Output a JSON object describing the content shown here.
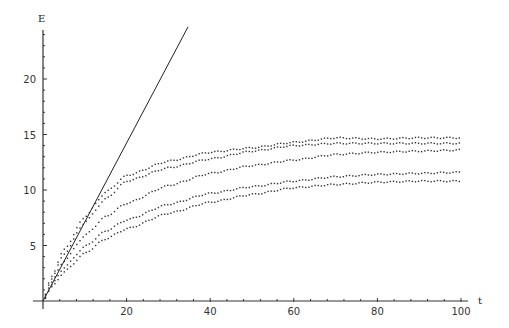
{
  "chart_data": {
    "type": "scatter",
    "title": "",
    "xlabel": "t",
    "ylabel": "E",
    "xlim": [
      0,
      100
    ],
    "ylim": [
      0,
      25
    ],
    "x_ticks": [
      20,
      40,
      60,
      80,
      100
    ],
    "y_ticks": [
      5,
      10,
      15,
      20
    ],
    "x_minor_step": 4,
    "y_minor_step": 1,
    "grid": false,
    "legend": "none",
    "line": {
      "name": "linear",
      "style": "solid",
      "x": [
        0,
        34.7
      ],
      "y": [
        0,
        24.7
      ]
    },
    "series": [
      {
        "name": "curve-1",
        "style": "dotted",
        "x": [
          0,
          2,
          5,
          10,
          15,
          20,
          30,
          40,
          50,
          60,
          70,
          80,
          90,
          100
        ],
        "y": [
          0,
          2.2,
          4.6,
          7.6,
          9.8,
          11.3,
          12.6,
          13.4,
          13.8,
          14.3,
          14.7,
          14.6,
          14.7,
          14.7
        ]
      },
      {
        "name": "curve-2",
        "style": "dotted",
        "x": [
          0,
          2,
          5,
          10,
          15,
          20,
          30,
          40,
          50,
          60,
          70,
          80,
          90,
          100
        ],
        "y": [
          0,
          2.0,
          4.2,
          7.1,
          9.2,
          10.8,
          12.0,
          12.8,
          13.5,
          14.0,
          14.2,
          14.2,
          14.2,
          14.2
        ]
      },
      {
        "name": "curve-3",
        "style": "dotted",
        "x": [
          0,
          2,
          5,
          10,
          15,
          20,
          30,
          40,
          50,
          60,
          70,
          80,
          90,
          100
        ],
        "y": [
          0,
          1.7,
          3.6,
          5.9,
          7.6,
          8.8,
          10.4,
          11.5,
          12.2,
          12.7,
          13.2,
          13.4,
          13.5,
          13.6
        ]
      },
      {
        "name": "curve-4",
        "style": "dotted",
        "x": [
          0,
          2,
          5,
          10,
          15,
          20,
          30,
          40,
          50,
          60,
          70,
          80,
          90,
          100
        ],
        "y": [
          0,
          1.4,
          3.0,
          4.9,
          6.3,
          7.3,
          8.7,
          9.7,
          10.3,
          10.8,
          11.2,
          11.4,
          11.5,
          11.6
        ]
      },
      {
        "name": "curve-5",
        "style": "dotted",
        "x": [
          0,
          2,
          5,
          10,
          15,
          20,
          30,
          40,
          50,
          60,
          70,
          80,
          90,
          100
        ],
        "y": [
          0,
          1.2,
          2.6,
          4.3,
          5.6,
          6.5,
          7.9,
          8.9,
          9.6,
          10.2,
          10.5,
          10.7,
          10.8,
          10.8
        ]
      }
    ]
  }
}
